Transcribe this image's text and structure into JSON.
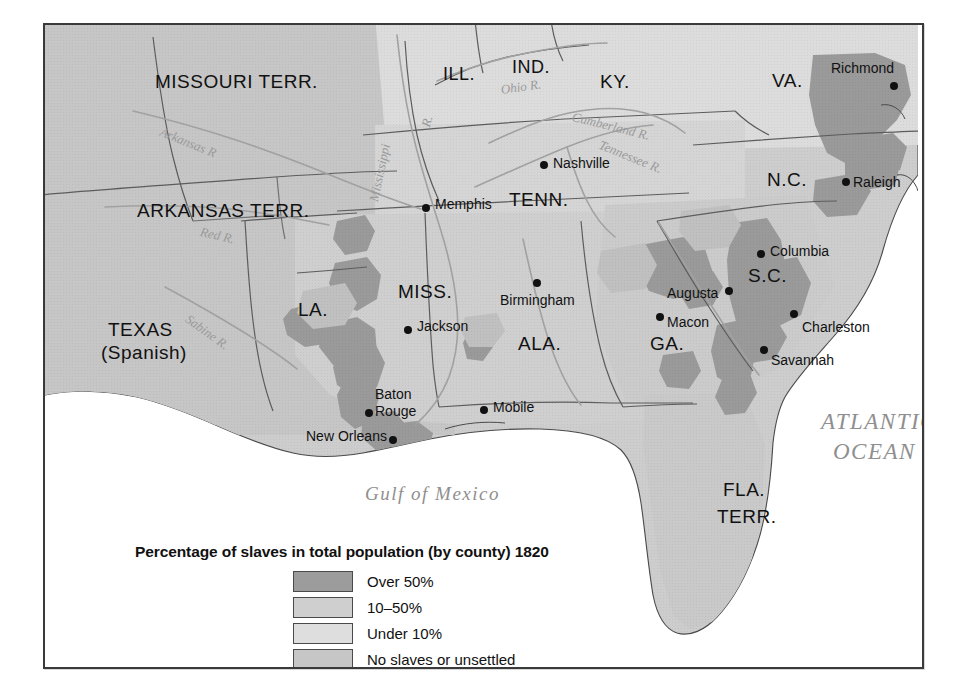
{
  "figure": {
    "kind": "historical-thematic-map",
    "region": "Southeastern United States"
  },
  "legend": {
    "title": "Percentage of slaves in total population (by county) 1820",
    "items": [
      {
        "label": "Over 50%",
        "color": "#9c9c9c"
      },
      {
        "label": "10–50%",
        "color": "#cfcfcf"
      },
      {
        "label": "Under 10%",
        "color": "#dedede"
      },
      {
        "label": "No slaves or unsettled",
        "color": "#c6c6c6"
      }
    ]
  },
  "states": [
    {
      "name": "MISSOURI  TERR.",
      "x": 110,
      "y": 47,
      "size": 19
    },
    {
      "name": "ILL.",
      "x": 398,
      "y": 40,
      "size": 18
    },
    {
      "name": "IND.",
      "x": 467,
      "y": 33,
      "size": 18
    },
    {
      "name": "KY.",
      "x": 555,
      "y": 47,
      "size": 19
    },
    {
      "name": "VA.",
      "x": 727,
      "y": 46,
      "size": 19
    },
    {
      "name": "N.C.",
      "x": 722,
      "y": 145,
      "size": 19
    },
    {
      "name": "ARKANSAS  TERR.",
      "x": 92,
      "y": 176,
      "size": 19
    },
    {
      "name": "TENN.",
      "x": 464,
      "y": 165,
      "size": 19
    },
    {
      "name": "S.C.",
      "x": 703,
      "y": 241,
      "size": 19
    },
    {
      "name": "MISS.",
      "x": 353,
      "y": 257,
      "size": 19
    },
    {
      "name": "LA.",
      "x": 253,
      "y": 275,
      "size": 19
    },
    {
      "name": "ALA.",
      "x": 473,
      "y": 309,
      "size": 19
    },
    {
      "name": "GA.",
      "x": 605,
      "y": 309,
      "size": 19
    },
    {
      "name": "TEXAS",
      "x": 63,
      "y": 295,
      "size": 19
    },
    {
      "name": "(Spanish)",
      "x": 56,
      "y": 318,
      "size": 19
    },
    {
      "name": "FLA.",
      "x": 678,
      "y": 455,
      "size": 19
    },
    {
      "name": "TERR.",
      "x": 672,
      "y": 482,
      "size": 19
    }
  ],
  "cities": [
    {
      "name": "Richmond",
      "label_x": 786,
      "label_y": 36,
      "dot_x": 845,
      "dot_y": 57,
      "align": "left"
    },
    {
      "name": "Nashville",
      "label_x": 508,
      "label_y": 131,
      "dot_x": 495,
      "dot_y": 136,
      "align": "left"
    },
    {
      "name": "Raleigh",
      "label_x": 808,
      "label_y": 150,
      "dot_x": 797,
      "dot_y": 153,
      "align": "left"
    },
    {
      "name": "Memphis",
      "label_x": 390,
      "label_y": 172,
      "dot_x": 377,
      "dot_y": 179,
      "align": "left"
    },
    {
      "name": "Columbia",
      "label_x": 725,
      "label_y": 219,
      "dot_x": 712,
      "dot_y": 225,
      "align": "left"
    },
    {
      "name": "Augusta",
      "label_x": 622,
      "label_y": 261,
      "dot_x": 680,
      "dot_y": 262,
      "align": "left"
    },
    {
      "name": "Birmingham",
      "label_x": 455,
      "label_y": 268,
      "dot_x": 488,
      "dot_y": 254,
      "align": "left"
    },
    {
      "name": "Macon",
      "label_x": 622,
      "label_y": 290,
      "dot_x": 611,
      "dot_y": 288,
      "align": "left"
    },
    {
      "name": "Jackson",
      "label_x": 372,
      "label_y": 294,
      "dot_x": 359,
      "dot_y": 301,
      "align": "left"
    },
    {
      "name": "Charleston",
      "label_x": 757,
      "label_y": 295,
      "dot_x": 745,
      "dot_y": 285,
      "align": "left"
    },
    {
      "name": "Savannah",
      "label_x": 726,
      "label_y": 328,
      "dot_x": 715,
      "dot_y": 321,
      "align": "left"
    },
    {
      "name": "Baton",
      "label_x": 330,
      "label_y": 362,
      "dot_x": 0,
      "dot_y": 0,
      "align": "left"
    },
    {
      "name": "Rouge",
      "label_x": 330,
      "label_y": 379,
      "dot_x": 320,
      "dot_y": 384,
      "align": "left"
    },
    {
      "name": "Mobile",
      "label_x": 448,
      "label_y": 375,
      "dot_x": 435,
      "dot_y": 381,
      "align": "left"
    },
    {
      "name": "New Orleans",
      "label_x": 261,
      "label_y": 404,
      "dot_x": 344,
      "dot_y": 411,
      "align": "left"
    }
  ],
  "rivers": [
    {
      "name": "Ohio R.",
      "x": 455,
      "y": 58,
      "rotate": -8
    },
    {
      "name": "Cumberland R.",
      "x": 529,
      "y": 85,
      "rotate": 14
    },
    {
      "name": "Tennessee R.",
      "x": 557,
      "y": 113,
      "rotate": 22
    },
    {
      "name": "Arkansas R",
      "x": 118,
      "y": 100,
      "rotate": 22
    },
    {
      "name": "R.",
      "x": 374,
      "y": 100,
      "rotate": -75
    },
    {
      "name": "Mississippi",
      "x": 322,
      "y": 175,
      "rotate": -78
    },
    {
      "name": "Red R.",
      "x": 157,
      "y": 200,
      "rotate": 13
    },
    {
      "name": "Sabine R.",
      "x": 146,
      "y": 287,
      "rotate": 36
    }
  ],
  "oceans": [
    {
      "name": "ATLANTIC",
      "x": 776,
      "y": 385,
      "size": 23
    },
    {
      "name": "OCEAN",
      "x": 788,
      "y": 415,
      "size": 23
    },
    {
      "name": "Gulf of Mexico",
      "x": 320,
      "y": 459,
      "size": 19
    }
  ],
  "colors": {
    "land_base": "#cdcdcd",
    "over50": "#9c9c9c",
    "mid": "#cfcfcf",
    "under10": "#dcdcdc",
    "unsettled": "#c5c5c5",
    "ocean": "#ffffff",
    "border_line": "#5d5d5d",
    "coast_line": "#4a4a4a",
    "river_line": "#a2a2a2",
    "frame": "#3a3a3a"
  }
}
